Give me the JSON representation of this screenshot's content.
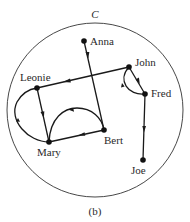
{
  "set_label": "C",
  "caption": "(b)",
  "colors": {
    "ink": "#1a1a1a",
    "background": "#ffffff"
  },
  "nodes": [
    {
      "id": "anna",
      "label": "Anna",
      "x": 84,
      "y": 41
    },
    {
      "id": "john",
      "label": "John",
      "x": 129,
      "y": 67
    },
    {
      "id": "fred",
      "label": "Fred",
      "x": 145,
      "y": 94
    },
    {
      "id": "leonie",
      "label": "Leonie",
      "x": 37,
      "y": 88
    },
    {
      "id": "mary",
      "label": "Mary",
      "x": 49,
      "y": 142
    },
    {
      "id": "bert",
      "label": "Bert",
      "x": 104,
      "y": 130
    },
    {
      "id": "joe",
      "label": "Joe",
      "x": 143,
      "y": 160
    }
  ],
  "edges": [
    {
      "from": "Anna",
      "to": "Bert",
      "shape": "straight"
    },
    {
      "from": "John",
      "to": "Leonie",
      "shape": "straight"
    },
    {
      "from": "John",
      "to": "Fred",
      "shape": "straight"
    },
    {
      "from": "Fred",
      "to": "John",
      "shape": "arc"
    },
    {
      "from": "Fred",
      "to": "Joe",
      "shape": "straight"
    },
    {
      "from": "Leonie",
      "to": "Mary",
      "shape": "straight"
    },
    {
      "from": "Mary",
      "to": "Leonie",
      "shape": "arc"
    },
    {
      "from": "Bert",
      "to": "Mary",
      "shape": "straight"
    },
    {
      "from": "Mary",
      "to": "Bert",
      "shape": "arc"
    }
  ]
}
